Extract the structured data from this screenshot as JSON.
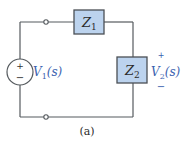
{
  "diagram": {
    "type": "circuit",
    "components": {
      "z1": {
        "label": "Z",
        "subscript": "1"
      },
      "z2": {
        "label": "Z",
        "subscript": "2"
      },
      "source": {
        "label_v": "V",
        "label_sub": "1",
        "label_arg": "(s)",
        "plus": "+",
        "minus": "−"
      },
      "output": {
        "label_v": "V",
        "label_sub": "2",
        "label_arg": "(s)",
        "plus": "+",
        "minus": "−"
      }
    },
    "caption": "(a)",
    "colors": {
      "impedance_fill": "#bcd3ee",
      "label_blue": "#3a63b0",
      "wire": "#555a5e"
    }
  }
}
